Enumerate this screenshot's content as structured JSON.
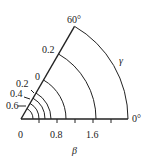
{
  "diagram": {
    "type": "polar-sector",
    "angle_labels": {
      "start": "0°",
      "end": "60°"
    },
    "radial_axis": {
      "label": "β",
      "tick_labels": [
        "0",
        "0.8",
        "1.6"
      ]
    },
    "arc_axis_label": "γ",
    "contour_labels": [
      "0.2",
      "0",
      "0.2",
      "0.4",
      "0.6"
    ],
    "colors": {
      "line": "#222222",
      "background": "#ffffff"
    }
  }
}
